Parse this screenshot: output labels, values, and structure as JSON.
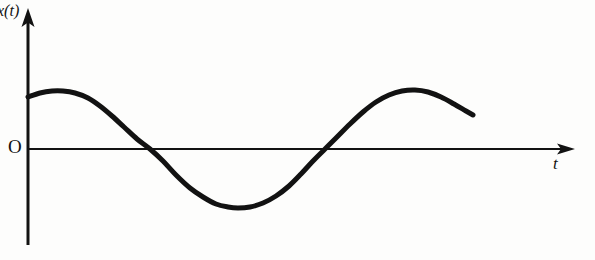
{
  "figure": {
    "background_color": "#fdfdfc",
    "ink_color": "#121212",
    "width": 595,
    "height": 260
  },
  "labels": {
    "y_axis": "x(t)",
    "origin": "O",
    "x_axis": "t"
  },
  "chart_data": {
    "type": "line",
    "title": "",
    "xlabel": "t",
    "ylabel": "x(t)",
    "grid": false,
    "legend": null,
    "axes": {
      "x_axis_y_px": 149,
      "y_axis_x_px": 28,
      "x_axis_start_px": 28,
      "x_axis_end_px": 575,
      "y_axis_top_px": 8,
      "y_axis_bottom_px": 245,
      "x_arrow": true,
      "y_arrow": true,
      "tick_labels_x": [],
      "tick_labels_y": []
    },
    "series": [
      {
        "name": "x(t)",
        "description": "hand-drawn sinusoid, amplitude ~59 px, period ~352 px, starting near positive peak",
        "color": "#121212",
        "line_width_px": 5,
        "points_px": [
          [
            28,
            97
          ],
          [
            40,
            93
          ],
          [
            52,
            91
          ],
          [
            63,
            91
          ],
          [
            75,
            93
          ],
          [
            88,
            98
          ],
          [
            100,
            106
          ],
          [
            112,
            116
          ],
          [
            124,
            127
          ],
          [
            137,
            139
          ],
          [
            150,
            149
          ],
          [
            163,
            161
          ],
          [
            176,
            175
          ],
          [
            190,
            188
          ],
          [
            203,
            197
          ],
          [
            216,
            204
          ],
          [
            228,
            207
          ],
          [
            238,
            208
          ],
          [
            250,
            207
          ],
          [
            263,
            203
          ],
          [
            276,
            196
          ],
          [
            289,
            186
          ],
          [
            301,
            174
          ],
          [
            313,
            161
          ],
          [
            325,
            149
          ],
          [
            337,
            137
          ],
          [
            350,
            124
          ],
          [
            363,
            112
          ],
          [
            376,
            102
          ],
          [
            389,
            95
          ],
          [
            402,
            91
          ],
          [
            415,
            90
          ],
          [
            428,
            92
          ],
          [
            441,
            97
          ],
          [
            454,
            104
          ],
          [
            466,
            111
          ],
          [
            473,
            115
          ]
        ],
        "features": {
          "first_maximum_px": [
            63,
            91
          ],
          "first_zero_crossing_px": [
            150,
            149
          ],
          "minimum_px": [
            238,
            208
          ],
          "second_zero_crossing_px": [
            325,
            149
          ],
          "second_maximum_px": [
            415,
            90
          ],
          "curve_start_px": [
            28,
            97
          ],
          "curve_end_px": [
            473,
            115
          ]
        }
      }
    ]
  }
}
